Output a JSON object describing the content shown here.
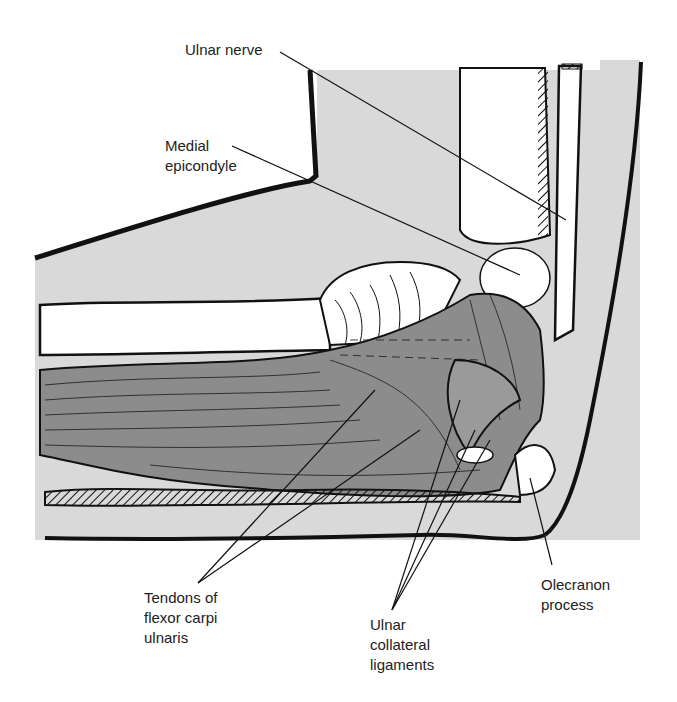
{
  "diagram": {
    "colors": {
      "background": "#ffffff",
      "skin_fill": "#d9d9d9",
      "muscle_fill": "#8c8c8c",
      "outline": "#111111",
      "label_text": "#222222"
    },
    "labels": [
      {
        "id": "ulnar-nerve",
        "lines": [
          "Ulnar nerve"
        ],
        "x": 185,
        "y": 40
      },
      {
        "id": "medial-epicondyle",
        "lines": [
          "Medial",
          "epicondyle"
        ],
        "x": 165,
        "y": 138
      },
      {
        "id": "tendons-fcu",
        "lines": [
          "Tendons of",
          "flexor carpi",
          "ulnaris"
        ],
        "x": 144,
        "y": 590
      },
      {
        "id": "ulnar-collateral-ligaments",
        "lines": [
          "Ulnar",
          "collateral",
          "ligaments"
        ],
        "x": 370,
        "y": 617
      },
      {
        "id": "olecranon-process",
        "lines": [
          "Olecranon",
          "process"
        ],
        "x": 541,
        "y": 577
      }
    ]
  }
}
